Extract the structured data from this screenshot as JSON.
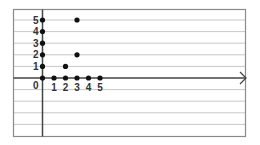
{
  "chart_data": {
    "type": "scatter",
    "title": "",
    "xlabel": "",
    "ylabel": "",
    "x_ticks": [
      "0",
      "1",
      "2",
      "3",
      "4",
      "5"
    ],
    "y_ticks": [
      "1",
      "2",
      "3",
      "4",
      "5"
    ],
    "origin_label": "0",
    "xlim": [
      0,
      5
    ],
    "ylim": [
      0,
      5
    ],
    "grid": "horizontal",
    "points": [
      {
        "x": 0,
        "y": 0
      },
      {
        "x": 0,
        "y": 1
      },
      {
        "x": 0,
        "y": 2
      },
      {
        "x": 0,
        "y": 3
      },
      {
        "x": 0,
        "y": 4
      },
      {
        "x": 0,
        "y": 5
      },
      {
        "x": 1,
        "y": 0
      },
      {
        "x": 2,
        "y": 0
      },
      {
        "x": 2,
        "y": 1
      },
      {
        "x": 3,
        "y": 0
      },
      {
        "x": 3,
        "y": 2
      },
      {
        "x": 3,
        "y": 5
      },
      {
        "x": 4,
        "y": 0
      },
      {
        "x": 5,
        "y": 0
      }
    ]
  },
  "colors": {
    "grid": "#c8c8c8",
    "frame": "#8a8a8a",
    "axis": "#444444",
    "point": "#111111"
  }
}
